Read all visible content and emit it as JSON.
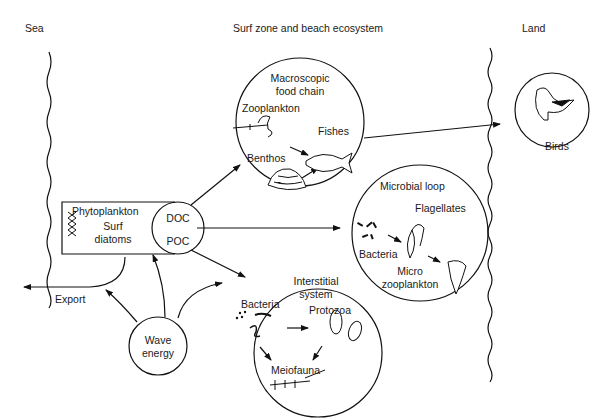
{
  "regions": {
    "sea": "Sea",
    "surf_zone": "Surf zone and beach ecosystem",
    "land": "Land"
  },
  "nodes": {
    "phytoplankton": {
      "title": "Phytoplankton",
      "line1": "Surf",
      "line2": "diatoms"
    },
    "doc_poc": {
      "line1": "DOC",
      "line2": "POC"
    },
    "wave_energy": {
      "line1": "Wave",
      "line2": "energy"
    },
    "export": "Export",
    "macroscopic": {
      "line1": "Macroscopic",
      "line2": "food chain",
      "zooplankton": "Zooplankton",
      "fishes": "Fishes",
      "benthos": "Benthos"
    },
    "microbial": {
      "title": "Microbial loop",
      "flagellates": "Flagellates",
      "bacteria": "Bacteria",
      "micro1": "Micro",
      "micro2": "zooplankton"
    },
    "interstitial": {
      "line1": "Interstitial",
      "line2": "system",
      "bacteria": "Bacteria",
      "protozoa": "Protozoa",
      "meiofauna": "Meiofauna"
    },
    "birds": "Birds"
  },
  "edges": [
    {
      "from": "doc_poc",
      "to": "macroscopic"
    },
    {
      "from": "doc_poc",
      "to": "microbial"
    },
    {
      "from": "doc_poc",
      "to": "interstitial"
    },
    {
      "from": "phytoplankton",
      "to": "export"
    },
    {
      "from": "wave_energy",
      "to": "export"
    },
    {
      "from": "wave_energy",
      "to": "doc_poc"
    },
    {
      "from": "wave_energy",
      "to": "interstitial"
    },
    {
      "from": "fishes",
      "to": "birds"
    },
    {
      "from": "zooplankton",
      "to": "fishes"
    },
    {
      "from": "benthos",
      "to": "fishes"
    },
    {
      "from": "bacteria",
      "to": "protozoa"
    },
    {
      "from": "bacteria",
      "to": "meiofauna"
    },
    {
      "from": "protozoa",
      "to": "meiofauna"
    },
    {
      "from": "microbial_bacteria",
      "to": "flagellates"
    },
    {
      "from": "flagellates",
      "to": "micro_zooplankton"
    }
  ]
}
